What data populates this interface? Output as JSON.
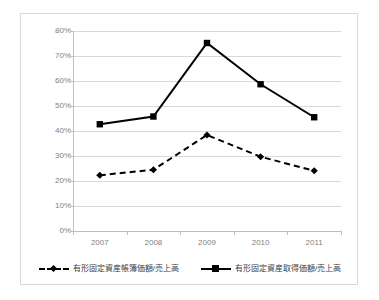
{
  "chart_data": {
    "type": "line",
    "title": "",
    "xlabel": "",
    "ylabel": "",
    "categories": [
      "2007",
      "2008",
      "2009",
      "2010",
      "2011"
    ],
    "ylim": [
      0,
      80
    ],
    "ytick_labels": [
      "0%",
      "10%",
      "20%",
      "30%",
      "40%",
      "50%",
      "60%",
      "70%",
      "80%"
    ],
    "ytick_values": [
      0,
      10,
      20,
      30,
      40,
      50,
      60,
      70,
      80
    ],
    "grid": true,
    "legend_position": "bottom",
    "series": [
      {
        "name": "有形固定資産帳簿価額/売上高",
        "style": "dashed",
        "marker": "diamond",
        "color": "#000000",
        "values": [
          22.3,
          24.5,
          38.4,
          29.7,
          24.1
        ]
      },
      {
        "name": "有形固定資産取得価額/売上高",
        "style": "solid",
        "marker": "square",
        "color": "#000000",
        "values": [
          42.7,
          45.8,
          75.2,
          58.7,
          45.5
        ]
      }
    ]
  },
  "legend": {
    "entries": [
      {
        "label": "有形固定資産帳簿価額/売上高"
      },
      {
        "label": "有形固定資産取得価額/売上高"
      }
    ]
  },
  "colors": {
    "series": "#000000",
    "gridline": "#d9d9d9",
    "axis": "#bfbfbf",
    "tick_text": "#7f7f7f",
    "frame_border": "#d9d9d9",
    "background": "#ffffff"
  }
}
